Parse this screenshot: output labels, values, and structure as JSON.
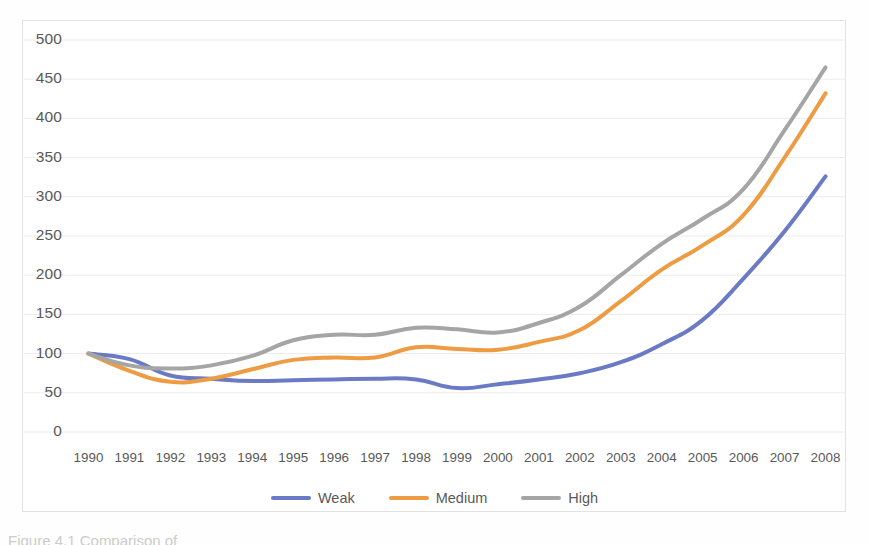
{
  "chart_data": {
    "type": "line",
    "title": "",
    "xlabel": "",
    "ylabel": "",
    "categories": [
      "1990",
      "1991",
      "1992",
      "1993",
      "1994",
      "1995",
      "1996",
      "1997",
      "1998",
      "1999",
      "2000",
      "2001",
      "2002",
      "2003",
      "2004",
      "2005",
      "2006",
      "2007",
      "2008"
    ],
    "x": [
      1990,
      1991,
      1992,
      1993,
      1994,
      1995,
      1996,
      1997,
      1998,
      1999,
      2000,
      2001,
      2002,
      2003,
      2004,
      2005,
      2006,
      2007,
      2008
    ],
    "series": [
      {
        "name": "Weak",
        "color": "#6B7AC4",
        "values": [
          100,
          93,
          72,
          68,
          65,
          66,
          67,
          68,
          67,
          56,
          61,
          67,
          75,
          89,
          112,
          143,
          196,
          256,
          326
        ]
      },
      {
        "name": "Medium",
        "color": "#ED9C43",
        "values": [
          100,
          78,
          64,
          68,
          80,
          92,
          95,
          95,
          108,
          106,
          105,
          115,
          130,
          167,
          207,
          238,
          277,
          350,
          432
        ]
      },
      {
        "name": "High",
        "color": "#A5A5A5",
        "values": [
          100,
          85,
          81,
          85,
          97,
          117,
          124,
          124,
          133,
          131,
          127,
          139,
          160,
          200,
          240,
          272,
          310,
          385,
          465
        ]
      }
    ],
    "ylim": [
      0,
      500
    ],
    "ytick_step": 50,
    "yticks": [
      0,
      50,
      100,
      150,
      200,
      250,
      300,
      350,
      400,
      450,
      500
    ],
    "grid": true,
    "grid_color": "#ececec",
    "legend_position": "bottom",
    "line_width": 4
  },
  "legend": {
    "items": [
      {
        "label": "Weak",
        "color": "#6B7AC4"
      },
      {
        "label": "Medium",
        "color": "#ED9C43"
      },
      {
        "label": "High",
        "color": "#A5A5A5"
      }
    ]
  },
  "caption": {
    "text": "Figure 4.1  Comparison of"
  },
  "colors": {
    "weak": "#6B7AC4",
    "medium": "#ED9C43",
    "high": "#A5A5A5",
    "axis_text": "#595959",
    "grid": "#ececec",
    "frame": "#e2e2e2"
  }
}
